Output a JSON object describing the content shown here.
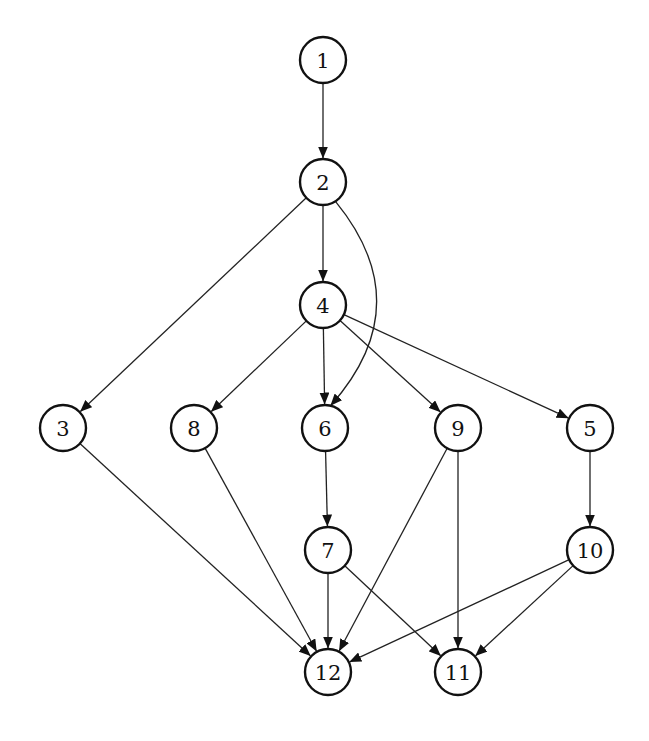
{
  "diagram": {
    "type": "directed-graph",
    "node_radius": 23,
    "colors": {
      "stroke": "#111111",
      "fill": "#ffffff",
      "edge": "#222222"
    },
    "nodes": [
      {
        "id": "1",
        "label": "1",
        "x": 323,
        "y": 60
      },
      {
        "id": "2",
        "label": "2",
        "x": 323,
        "y": 182
      },
      {
        "id": "4",
        "label": "4",
        "x": 323,
        "y": 305
      },
      {
        "id": "3",
        "label": "3",
        "x": 63,
        "y": 428
      },
      {
        "id": "8",
        "label": "8",
        "x": 194,
        "y": 428
      },
      {
        "id": "6",
        "label": "6",
        "x": 325,
        "y": 428
      },
      {
        "id": "9",
        "label": "9",
        "x": 458,
        "y": 428
      },
      {
        "id": "5",
        "label": "5",
        "x": 590,
        "y": 428
      },
      {
        "id": "7",
        "label": "7",
        "x": 328,
        "y": 550
      },
      {
        "id": "10",
        "label": "10",
        "x": 590,
        "y": 550
      },
      {
        "id": "12",
        "label": "12",
        "x": 328,
        "y": 672
      },
      {
        "id": "11",
        "label": "11",
        "x": 458,
        "y": 672
      }
    ],
    "edges": [
      {
        "from": "1",
        "to": "2"
      },
      {
        "from": "2",
        "to": "4"
      },
      {
        "from": "2",
        "to": "3"
      },
      {
        "from": "2",
        "to": "6",
        "curved": true
      },
      {
        "from": "4",
        "to": "8"
      },
      {
        "from": "4",
        "to": "6"
      },
      {
        "from": "4",
        "to": "9"
      },
      {
        "from": "4",
        "to": "5"
      },
      {
        "from": "6",
        "to": "7"
      },
      {
        "from": "5",
        "to": "10"
      },
      {
        "from": "3",
        "to": "12"
      },
      {
        "from": "8",
        "to": "12"
      },
      {
        "from": "7",
        "to": "12"
      },
      {
        "from": "9",
        "to": "12"
      },
      {
        "from": "10",
        "to": "12"
      },
      {
        "from": "7",
        "to": "11"
      },
      {
        "from": "9",
        "to": "11"
      },
      {
        "from": "10",
        "to": "11"
      }
    ]
  }
}
